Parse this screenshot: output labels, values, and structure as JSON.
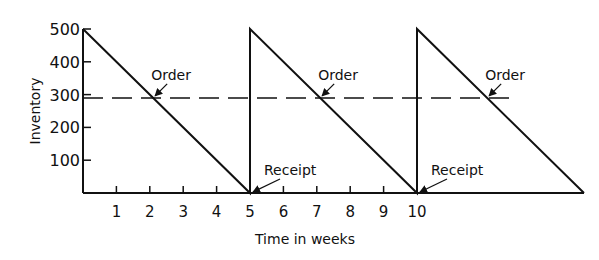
{
  "chart_data": {
    "type": "line",
    "title": "",
    "xlabel": "Time in weeks",
    "ylabel": "Inventory",
    "xlim": [
      0,
      15
    ],
    "ylim": [
      0,
      500
    ],
    "x_ticks": [
      1,
      2,
      3,
      4,
      5,
      6,
      7,
      8,
      9,
      10
    ],
    "x_tick_labels": [
      "1",
      "2",
      "3",
      "4",
      "5",
      "6",
      "7",
      "8",
      "9",
      "10"
    ],
    "y_ticks": [
      100,
      200,
      300,
      400,
      500
    ],
    "y_tick_labels": [
      "100",
      "200",
      "300",
      "400",
      "500"
    ],
    "grid": false,
    "legend": null,
    "series": [
      {
        "name": "Inventory level",
        "style": "solid",
        "x": [
          0,
          5,
          5,
          10,
          10,
          15
        ],
        "y": [
          500,
          0,
          500,
          0,
          500,
          0
        ]
      },
      {
        "name": "Reorder point",
        "style": "dashed",
        "x": [
          0,
          13
        ],
        "y": [
          290,
          290
        ]
      }
    ],
    "annotations": [
      {
        "text": "Order",
        "x": 2.1,
        "y": 290
      },
      {
        "text": "Order",
        "x": 7.1,
        "y": 290
      },
      {
        "text": "Order",
        "x": 12.1,
        "y": 290
      },
      {
        "text": "Receipt",
        "x": 5,
        "y": 0
      },
      {
        "text": "Receipt",
        "x": 10,
        "y": 0
      }
    ]
  }
}
